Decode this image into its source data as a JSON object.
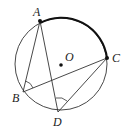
{
  "diagram": {
    "type": "circle-geometry",
    "circle": {
      "center_label": "O",
      "cx": 61,
      "cy": 64,
      "r": 46
    },
    "points": [
      {
        "label": "A",
        "x": 40,
        "y": 21,
        "label_x": 33,
        "label_y": 16,
        "filled": true
      },
      {
        "label": "C",
        "x": 107,
        "y": 58,
        "label_x": 112,
        "label_y": 62,
        "filled": true
      },
      {
        "label": "B",
        "x": 23,
        "y": 92,
        "label_x": 12,
        "label_y": 102,
        "filled": false
      },
      {
        "label": "D",
        "x": 58,
        "y": 112,
        "label_x": 53,
        "label_y": 126,
        "filled": false
      }
    ],
    "center_dot": {
      "x": 61,
      "y": 65
    },
    "center_label_pos": {
      "x": 65,
      "y": 61
    },
    "segments": [
      "AB",
      "AD",
      "BC",
      "DC"
    ],
    "bold_arc": "AC",
    "angle_marks": [
      "ABC",
      "ADC"
    ]
  }
}
